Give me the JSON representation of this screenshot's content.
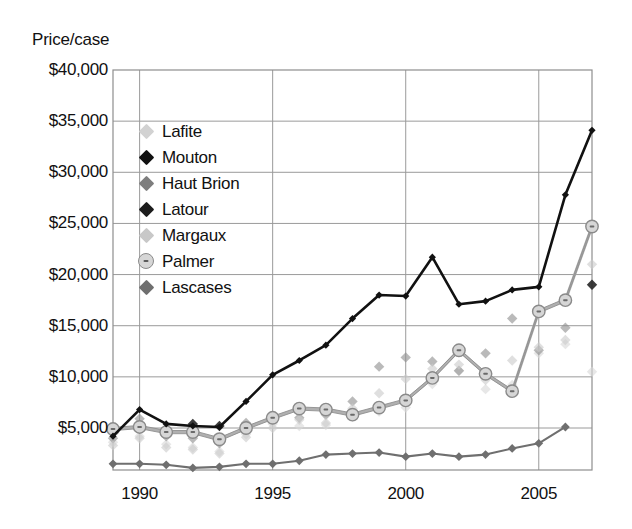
{
  "axis_title": "Price/case",
  "legend": {
    "items": [
      {
        "label": "Lafite",
        "marker": "diamond",
        "color": "#d2d2d2"
      },
      {
        "label": "Mouton",
        "marker": "diamond",
        "color": "#111111"
      },
      {
        "label": "Haut Brion",
        "marker": "diamond",
        "color": "#7e7e7e"
      },
      {
        "label": "Latour",
        "marker": "diamond",
        "color": "#1c1c1c"
      },
      {
        "label": "Margaux",
        "marker": "diamond",
        "color": "#c8c8c8"
      },
      {
        "label": "Palmer",
        "marker": "circle-dot",
        "color": "#d6d6d6"
      },
      {
        "label": "Lascases",
        "marker": "diamond",
        "color": "#6f6f6f"
      }
    ]
  },
  "chart_data": {
    "type": "line",
    "title": "",
    "xlabel": "",
    "ylabel": "Price/case",
    "ylim": [
      0,
      40000
    ],
    "xlim": [
      1989,
      2007
    ],
    "grid": true,
    "legend_position": "inside-top-left",
    "ytick_labels": [
      "$40,000",
      "$35,000",
      "$30,000",
      "$25,000",
      "$20,000",
      "$15,000",
      "$10,000",
      "$5,000"
    ],
    "ytick_values": [
      40000,
      35000,
      30000,
      25000,
      20000,
      15000,
      10000,
      5000
    ],
    "xtick_labels": [
      "1990",
      "1995",
      "2000",
      "2005"
    ],
    "xtick_values": [
      1990,
      1995,
      2000,
      2005
    ],
    "x": [
      1989,
      1990,
      1991,
      1992,
      1993,
      1994,
      1995,
      1996,
      1997,
      1998,
      1999,
      2000,
      2001,
      2002,
      2003,
      2004,
      2005,
      2006,
      2007
    ],
    "series": [
      {
        "name": "Latour",
        "style": "line",
        "color": "#1c1c1c",
        "values": [
          4200,
          6800,
          5400,
          5200,
          5100,
          7600,
          10200,
          11600,
          13100,
          15700,
          18000,
          17900,
          21700,
          17100,
          17400,
          18500,
          18800,
          27800,
          34100
        ]
      },
      {
        "name": "Palmer",
        "style": "line",
        "color": "#b9b9b9",
        "values": [
          4900,
          5100,
          4600,
          4600,
          3900,
          5000,
          6000,
          6900,
          6800,
          6300,
          7000,
          7700,
          9900,
          12600,
          10300,
          8600,
          16400,
          17500,
          24700
        ]
      },
      {
        "name": "Lascases",
        "style": "line",
        "color": "#6f6f6f",
        "values": [
          1500,
          1500,
          1400,
          1100,
          1200,
          1500,
          1500,
          1800,
          2400,
          2500,
          2600,
          2200,
          2500,
          2200,
          2400,
          3000,
          3500,
          5100,
          null
        ]
      },
      {
        "name": "Lafite",
        "style": "scatter",
        "color": "#d9d9d9",
        "values": [
          3600,
          4200,
          3400,
          3100,
          2700,
          4400,
          5400,
          5200,
          5300,
          6100,
          6600,
          7000,
          9300,
          10600,
          8800,
          9200,
          12300,
          13200,
          10500
        ]
      },
      {
        "name": "Mouton",
        "style": "scatter",
        "color": "#2a2a2a",
        "values": [
          null,
          null,
          4600,
          5400,
          5200,
          null,
          null,
          null,
          null,
          null,
          null,
          null,
          null,
          null,
          null,
          null,
          null,
          null,
          19000
        ]
      },
      {
        "name": "Haut Brion",
        "style": "scatter",
        "color": "#8f8f8f",
        "values": [
          4000,
          5900,
          4200,
          4000,
          3500,
          5500,
          6200,
          6000,
          6300,
          7600,
          11000,
          11900,
          11500,
          10600,
          12300,
          15700,
          12600,
          14800,
          null
        ]
      },
      {
        "name": "Margaux",
        "style": "scatter",
        "color": "#cccccc",
        "values": [
          3300,
          4000,
          3100,
          2900,
          2500,
          4100,
          5000,
          5800,
          5500,
          6900,
          8400,
          9800,
          10800,
          11200,
          9700,
          11600,
          12900,
          13600,
          21000
        ]
      }
    ]
  }
}
